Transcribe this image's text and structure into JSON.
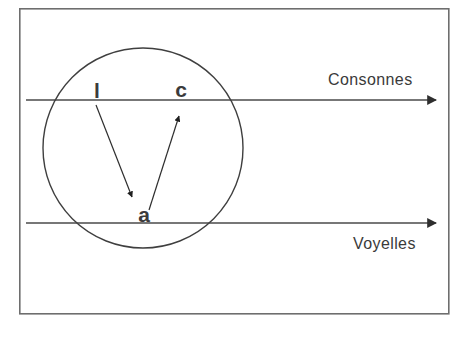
{
  "figure": {
    "background_color": "#ffffff",
    "frame": {
      "name": "outer-border",
      "x": 19,
      "y": 8,
      "width": 430,
      "height": 306,
      "stroke": "#6e6e6e",
      "stroke_width": 1.6
    },
    "circle": {
      "name": "syllable-circle",
      "cx": 143,
      "cy": 148,
      "r": 100,
      "stroke": "#3f3f3f",
      "stroke_width": 1.4,
      "fill": "none"
    },
    "axes": [
      {
        "id": "consonnes",
        "label": "Consonnes",
        "label_x": 328,
        "label_y": 85,
        "label_position": "above-line",
        "x1": 26,
        "y1": 100,
        "x2": 443,
        "y2": 100,
        "stroke": "#4a4a4a",
        "stroke_width": 1.4,
        "arrowhead": "filled-triangle"
      },
      {
        "id": "voyelles",
        "label": "Voyelles",
        "label_x": 353,
        "label_y": 249,
        "label_position": "below-line",
        "x1": 26,
        "y1": 223,
        "x2": 443,
        "y2": 223,
        "stroke": "#4a4a4a",
        "stroke_width": 1.4,
        "arrowhead": "filled-triangle"
      }
    ],
    "phonemes": [
      {
        "id": "l",
        "text": "l",
        "x": 97,
        "y": 98,
        "tier": "consonnes",
        "color": "#3b3b3b"
      },
      {
        "id": "c",
        "text": "c",
        "x": 181,
        "y": 97,
        "tier": "consonnes",
        "color": "#3b3b3b"
      },
      {
        "id": "a",
        "text": "a",
        "x": 144,
        "y": 222,
        "tier": "voyelles",
        "color": "#3b3b3b"
      }
    ],
    "arrows": [
      {
        "id": "l-to-a",
        "from": "l",
        "to": "a",
        "x1": 96,
        "y1": 105,
        "x2": 135,
        "y2": 202,
        "stroke": "#2e2e2e",
        "stroke_width": 1.2,
        "arrowhead": "filled-triangle"
      },
      {
        "id": "a-to-c",
        "from": "a",
        "to": "c",
        "x1": 149,
        "y1": 210,
        "x2": 180,
        "y2": 110,
        "stroke": "#2e2e2e",
        "stroke_width": 1.2,
        "arrowhead": "filled-triangle"
      }
    ]
  }
}
